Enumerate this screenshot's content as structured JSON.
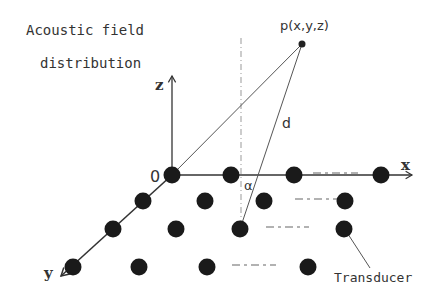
{
  "title": {
    "line1": "Acoustic field",
    "line2": "distribution"
  },
  "point_label": "p(x,y,z)",
  "distance_label": "d",
  "origin_label": "0",
  "angle_label": "α",
  "axes": {
    "x": "x",
    "y": "y",
    "z": "z"
  },
  "transducer_label": "Transducer",
  "colors": {
    "ink": "#333333",
    "dot": "#1a1a1a",
    "dash": "#999999"
  },
  "array": {
    "rows": [
      {
        "y": 175,
        "dots": [
          172,
          231,
          294,
          381
        ],
        "dash": [
          313,
          358
        ]
      },
      {
        "y": 201,
        "dots": [
          143,
          205,
          264,
          345
        ],
        "dash": [
          295,
          337
        ]
      },
      {
        "y": 229,
        "dots": [
          113,
          176,
          240,
          344
        ],
        "dash": [
          266,
          309
        ]
      },
      {
        "y": 267,
        "dots": [
          73,
          139,
          207,
          308
        ],
        "dash": [
          232,
          276
        ]
      }
    ]
  }
}
